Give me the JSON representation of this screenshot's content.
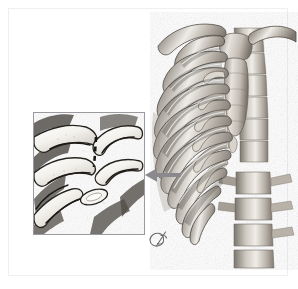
{
  "figure": {
    "title": "Anterior thoracic cage with magnified costochondral inset",
    "subject": "Human rib cage (three-dimensional reconstruction)",
    "background_color": "#ffffff",
    "border_color": "#efeff1",
    "width": 298,
    "height": 289
  },
  "main_view": {
    "name": "ribcage-3d-render",
    "description": "Oblique anterior view of the bony thorax showing clavicle, sternum, costal cartilages, ribs and vertebral column",
    "bone_light": "#e9e6e0",
    "bone_mid": "#b9b4ab",
    "bone_dark": "#7e7970",
    "shadow": "#55514b",
    "structures": [
      {
        "label": "clavicle",
        "region": "superior-lateral"
      },
      {
        "label": "manubrium",
        "region": "superior-medial"
      },
      {
        "label": "sternal body",
        "region": "central"
      },
      {
        "label": "xiphoid process",
        "region": "inferior-medial"
      },
      {
        "label": "true ribs 1-7",
        "region": "upper-lateral"
      },
      {
        "label": "false ribs 8-10",
        "region": "lower-lateral"
      },
      {
        "label": "costal cartilage",
        "region": "anterior-medial"
      },
      {
        "label": "thoracic vertebrae",
        "region": "posterior-medial"
      },
      {
        "label": "lumbar vertebrae",
        "region": "inferior-medial"
      }
    ]
  },
  "inset": {
    "name": "magnified-detail-panel",
    "description": "Close-up of costal cartilage and rib ends with dashed boundary marking",
    "frame_color": "#9a9a9e",
    "fill_color": "#fdfdfd",
    "x": 33,
    "y": 112,
    "width": 112,
    "height": 123,
    "annotation": {
      "type": "dashed-line",
      "meaning": "costochondral junction boundary",
      "color": "#1a1a1a"
    }
  },
  "arrow": {
    "name": "inset-pointer-arrow",
    "direction": "left",
    "color": "#8a8a8e",
    "from_region": "lower anterior rib cage",
    "to_region": "magnified detail panel"
  },
  "signature": {
    "name": "artist-monogram",
    "text": "",
    "glyph": "monogram",
    "color": "#6a6a6e"
  },
  "palette": {
    "bone_highlight": "#f2efea",
    "bone_base": "#cbc6bd",
    "bone_shade": "#8c877e",
    "outline": "#2a2a2a",
    "frame": "#9a9a9e"
  }
}
